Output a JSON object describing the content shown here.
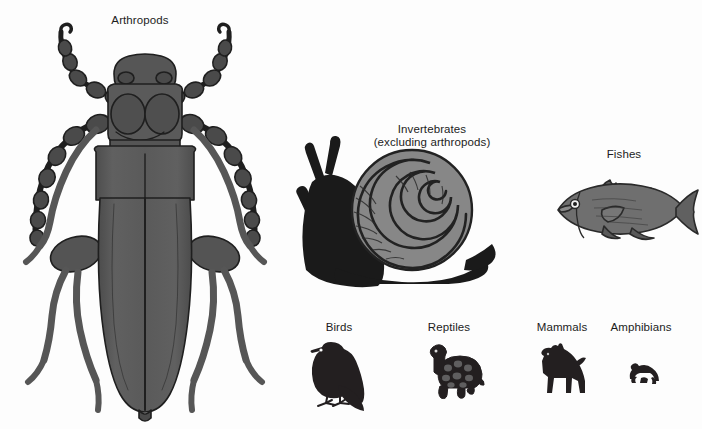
{
  "figure": {
    "background_color": "#fdfdfd",
    "label_color": "#1c1c1c"
  },
  "palette": {
    "beetle_body": "#5a5a5a",
    "beetle_outline": "#1f1f1f",
    "snail_body": "#1a1a1a",
    "snail_shell": "#878787",
    "snail_shell_line": "#222222",
    "fish_body": "#6f6f6f",
    "fish_outline": "#2a2a2a",
    "silhouette": "#231f20"
  },
  "groups": [
    {
      "key": "arthropods",
      "label": "Arthropods",
      "icon": "beetle-illustration",
      "label_x": 140,
      "label_y": 14,
      "relative_size": "largest"
    },
    {
      "key": "invertebrates",
      "label_line1": "Invertebrates",
      "label_line2": "(excluding arthropods)",
      "icon": "snail-illustration",
      "label_x": 432,
      "label_y": 123,
      "relative_size": "large"
    },
    {
      "key": "fishes",
      "label": "Fishes",
      "icon": "fish-illustration",
      "label_x": 624,
      "label_y": 148,
      "relative_size": "medium"
    },
    {
      "key": "birds",
      "label": "Birds",
      "icon": "bird-silhouette",
      "label_x": 339,
      "label_y": 321,
      "relative_size": "small"
    },
    {
      "key": "reptiles",
      "label": "Reptiles",
      "icon": "tortoise-silhouette",
      "label_x": 449,
      "label_y": 321,
      "relative_size": "small"
    },
    {
      "key": "mammals",
      "label": "Mammals",
      "icon": "horse-silhouette",
      "label_x": 562,
      "label_y": 321,
      "relative_size": "small"
    },
    {
      "key": "amphibians",
      "label": "Amphibians",
      "icon": "frog-silhouette",
      "label_x": 641,
      "label_y": 321,
      "relative_size": "smallest"
    }
  ]
}
